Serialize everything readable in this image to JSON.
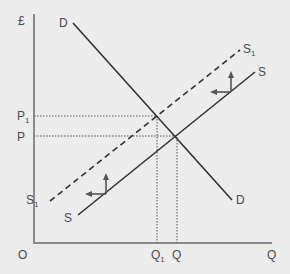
{
  "diagram": {
    "type": "supply-demand",
    "axes": {
      "y_label": "£",
      "x_label": "Q",
      "origin_label": "O"
    },
    "curves": [
      {
        "id": "D",
        "label": "D",
        "kind": "demand",
        "style": "solid"
      },
      {
        "id": "S",
        "label": "S",
        "kind": "supply",
        "style": "solid"
      },
      {
        "id": "S1",
        "label": "S",
        "subscript": "1",
        "kind": "supply-shifted",
        "style": "dashed"
      }
    ],
    "price_labels": [
      {
        "id": "P1",
        "label": "P",
        "subscript": "1"
      },
      {
        "id": "P",
        "label": "P",
        "subscript": ""
      }
    ],
    "quantity_labels": [
      {
        "id": "Q1",
        "label": "Q",
        "subscript": "1"
      },
      {
        "id": "Q",
        "label": "Q",
        "subscript": ""
      }
    ],
    "shift_arrows": [
      {
        "direction": "up-and-left",
        "meaning": "supply decrease"
      },
      {
        "direction": "up-and-left",
        "meaning": "supply decrease"
      }
    ]
  }
}
